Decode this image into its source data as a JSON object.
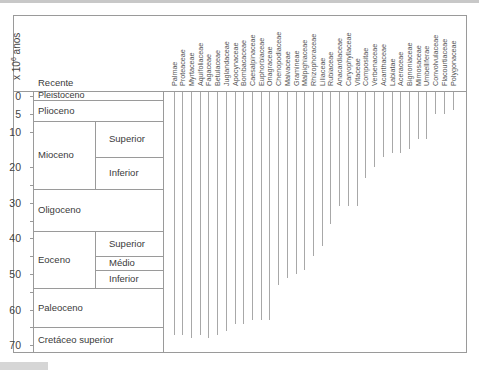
{
  "chart_data": {
    "type": "range",
    "title": "",
    "ylabel": "x 10^6 anos",
    "ylabel_parts": {
      "base": "x 10",
      "exp": "6",
      "unit": "anos"
    },
    "yticks": [
      0,
      5,
      10,
      20,
      30,
      40,
      50,
      60,
      70
    ],
    "ylim": [
      0,
      70
    ],
    "y_inverted": true,
    "header_label": "Recente",
    "periods": [
      {
        "name": "Pleistoceno",
        "start": 0,
        "end": 1
      },
      {
        "name": "Plioceno",
        "start": 1,
        "end": 7
      },
      {
        "name": "Mioceno",
        "start": 7,
        "end": 26,
        "sub": [
          {
            "name": "Superior",
            "start": 7,
            "end": 17
          },
          {
            "name": "Inferior",
            "start": 17,
            "end": 26
          }
        ]
      },
      {
        "name": "Oligoceno",
        "start": 26,
        "end": 38
      },
      {
        "name": "Eoceno",
        "start": 38,
        "end": 54,
        "sub": [
          {
            "name": "Superior",
            "start": 38,
            "end": 45
          },
          {
            "name": "Médio",
            "start": 45,
            "end": 49
          },
          {
            "name": "Inferior",
            "start": 49,
            "end": 54
          }
        ]
      },
      {
        "name": "Paleoceno",
        "start": 54,
        "end": 65
      },
      {
        "name": "Cretáceo superior",
        "start": 65,
        "end": 73
      }
    ],
    "categories": [
      "Palmae",
      "Proteaceae",
      "Myrtaceae",
      "Aquifoliaceae",
      "Fagaceae",
      "Betulaceae",
      "Juglandaceae",
      "Apocynaceae",
      "Bombacaceae",
      "Caesalpinaceae",
      "Euphorbiaceae",
      "Onagraceae",
      "Chenopodiaceae",
      "Malvaceae",
      "Gramineae",
      "Malpighiaceae",
      "Rhizophoraceae",
      "Liliaceae",
      "Rubiaceae",
      "Anacardiaceae",
      "Caryophyllaceae",
      "Vitaceae",
      "Compositae",
      "Verbenaceae",
      "Acanthaceae",
      "Labiatae",
      "Aceraceae",
      "Bignoniaceae",
      "Mimosaceae",
      "Umbelliferae",
      "Convolvulaceae",
      "Flacourtiaceae",
      "Polygonaceae"
    ],
    "values": [
      67,
      67,
      68,
      67,
      68,
      67,
      66,
      64,
      64,
      63,
      63,
      63,
      53,
      51,
      50,
      49,
      45,
      42,
      36,
      31,
      31,
      31,
      23,
      20,
      17,
      16,
      16,
      15,
      12,
      12,
      5,
      5,
      4
    ],
    "value_meaning": "earliest occurrence (x 10^6 anos), line extends from 0 (Recente) down to value",
    "grid": false,
    "legend": "none"
  }
}
